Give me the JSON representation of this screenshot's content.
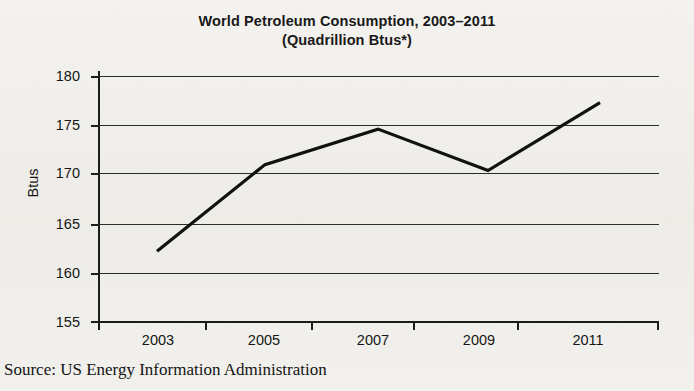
{
  "chart_data": {
    "type": "line",
    "title": "World Petroleum Consumption, 2003–2011",
    "subtitle": "(Quadrillion Btus*)",
    "xlabel": "",
    "ylabel": "Btus",
    "categories": [
      "2003",
      "2005",
      "2007",
      "2009",
      "2011"
    ],
    "x": [
      2003,
      2005,
      2007,
      2009,
      2011
    ],
    "values": [
      162.2,
      171.0,
      174.6,
      170.4,
      177.3
    ],
    "series": [
      {
        "name": "World Petroleum Consumption",
        "values": [
          162.2,
          171.0,
          174.6,
          170.4,
          177.3
        ]
      }
    ],
    "ylim": [
      155,
      180
    ],
    "yticks": [
      180,
      175,
      170,
      165,
      160,
      155
    ],
    "ytick_labels": [
      "180",
      "175",
      "170",
      "165",
      "160",
      "155"
    ],
    "xtick_labels": [
      "2003",
      "2005",
      "2007",
      "2009",
      "2011"
    ],
    "grid": true,
    "legend": false,
    "line_color": "#111111",
    "source": "Source: US Energy Information Administration"
  },
  "title": {
    "line1": "World Petroleum Consumption, 2003–2011",
    "line2": "(Quadrillion Btus*)"
  },
  "axes": {
    "y_title": "Btus",
    "y_labels": [
      "180",
      "175",
      "170",
      "165",
      "160",
      "155"
    ],
    "x_labels": [
      "2003",
      "2005",
      "2007",
      "2009",
      "2011"
    ]
  },
  "footer": {
    "source": "Source: US Energy Information Administration"
  }
}
